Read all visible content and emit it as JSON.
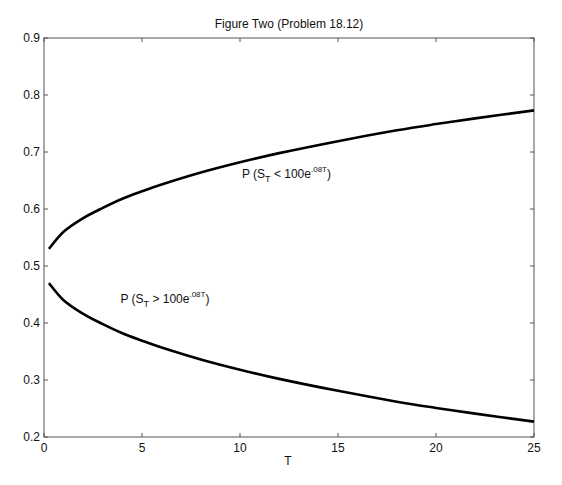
{
  "chart_data": {
    "type": "line",
    "title": "Figure Two (Problem 18.12)",
    "xlabel": "T",
    "ylabel": "",
    "xlim": [
      0,
      25
    ],
    "ylim": [
      0.2,
      0.9
    ],
    "xticks": [
      0,
      5,
      10,
      15,
      20,
      25
    ],
    "yticks": [
      0.2,
      0.3,
      0.4,
      0.5,
      0.6,
      0.7,
      0.8,
      0.9
    ],
    "xtick_labels": [
      "0",
      "5",
      "10",
      "15",
      "20",
      "25"
    ],
    "ytick_labels": [
      "0.2",
      "0.3",
      "0.4",
      "0.5",
      "0.6",
      "0.7",
      "0.8",
      "0.9"
    ],
    "grid": false,
    "legend": null,
    "x": [
      0.25,
      1,
      2,
      3,
      4,
      5,
      6,
      8,
      10,
      12,
      15,
      18,
      20,
      22,
      25
    ],
    "series": [
      {
        "name": "P (S_T < 100e^.08T)",
        "color": "#000000",
        "values": [
          0.53,
          0.56,
          0.584,
          0.602,
          0.618,
          0.631,
          0.643,
          0.664,
          0.682,
          0.698,
          0.719,
          0.738,
          0.749,
          0.759,
          0.773
        ]
      },
      {
        "name": "P (S_T > 100e^.08T)",
        "color": "#000000",
        "values": [
          0.47,
          0.44,
          0.416,
          0.398,
          0.382,
          0.369,
          0.357,
          0.336,
          0.318,
          0.302,
          0.281,
          0.262,
          0.251,
          0.241,
          0.227
        ]
      }
    ],
    "annotations": [
      {
        "text_main": "P (S",
        "sub": "T",
        "op": " < 100e",
        "sup": ".08T",
        "close": ")",
        "x": 10.1,
        "y": 0.655,
        "series": 0
      },
      {
        "text_main": "P (S",
        "sub": "T",
        "op": " > 100e",
        "sup": ".08T",
        "close": ")",
        "x": 3.9,
        "y": 0.435,
        "series": 1
      }
    ]
  }
}
